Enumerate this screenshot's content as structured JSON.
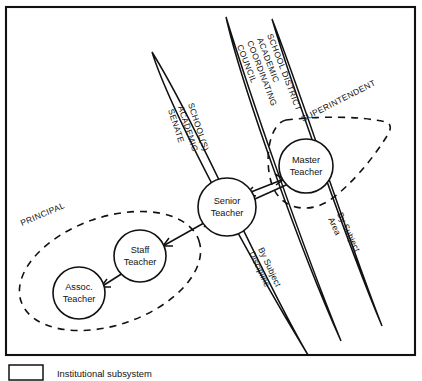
{
  "figure": {
    "type": "organizational-role-diagram",
    "frame": {
      "visible": true
    }
  },
  "nodes": [
    {
      "id": "assoc-teacher",
      "line1": "Assoc.",
      "line2": "Teacher"
    },
    {
      "id": "staff-teacher",
      "line1": "Staff",
      "line2": "Teacher"
    },
    {
      "id": "senior-teacher",
      "line1": "Senior",
      "line2": "Teacher"
    },
    {
      "id": "master-teacher",
      "line1": "Master",
      "line2": "Teacher"
    }
  ],
  "regions": [
    {
      "id": "principal",
      "label": "PRINCIPAL",
      "style": "dashed"
    },
    {
      "id": "superintendent",
      "label": "SUPERINTENDENT",
      "style": "dashed"
    }
  ],
  "lenses": [
    {
      "id": "school-academic-senate",
      "lines": [
        "SCHOOL(S)",
        "ACADEMIC",
        "SENATE"
      ],
      "sublabel": []
    },
    {
      "id": "school-district-academic-coordinating-council",
      "lines": [
        "SCHOOL DISTRICT",
        "ACADEMIC",
        "COORDINATING",
        "COUNCIL"
      ],
      "sublabel": [
        "By Subject",
        "Discipline"
      ]
    },
    {
      "id": "by-subject-area-lens",
      "lines": [],
      "sublabel": [
        "By Subject",
        "Area"
      ]
    }
  ],
  "lens_labels": {
    "senate_l1": "SCHOOL(S)",
    "senate_l2": "ACADEMIC",
    "senate_l3": "SENATE",
    "council_l1": "SCHOOL DISTRICT",
    "council_l2": "ACADEMIC",
    "council_l3": "COORDINATING",
    "council_l4": "COUNCIL",
    "discipline_l1": "By Subject",
    "discipline_l2": "Discipline",
    "area_l1": "By Subject",
    "area_l2": "Area"
  },
  "node_labels": {
    "assoc_l1": "Assoc.",
    "assoc_l2": "Teacher",
    "staff_l1": "Staff",
    "staff_l2": "Teacher",
    "senior_l1": "Senior",
    "senior_l2": "Teacher",
    "master_l1": "Master",
    "master_l2": "Teacher"
  },
  "region_labels": {
    "principal": "PRINCIPAL",
    "superintendent": "SUPERINTENDENT"
  },
  "legend": {
    "items": [
      {
        "id": "institutional-subsystem",
        "swatch": "empty-box",
        "text": "Institutional subsystem"
      }
    ],
    "institutional_subsystem": "Institutional subsystem"
  },
  "connections": [
    {
      "from": "assoc-teacher",
      "to": "staff-teacher",
      "arrow": "double"
    },
    {
      "from": "staff-teacher",
      "to": "senior-teacher",
      "arrow": "double"
    },
    {
      "from": "senior-teacher",
      "to": "master-teacher",
      "arrow": "double"
    }
  ],
  "colors": {
    "ink": "#111111",
    "paper": "#ffffff"
  }
}
